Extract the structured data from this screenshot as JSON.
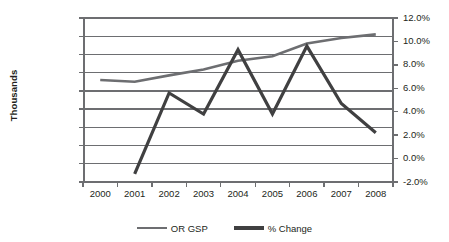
{
  "chart_data": {
    "type": "line",
    "title": "",
    "xlabel": "",
    "ylabel": "Thousands",
    "categories": [
      "2000",
      "2001",
      "2002",
      "2003",
      "2004",
      "2005",
      "2006",
      "2007",
      "2008"
    ],
    "grid": true,
    "legend_position": "bottom",
    "axes": {
      "left": {
        "label": "Thousands",
        "ylim": [
          0,
          180000
        ],
        "tick_step": 20000,
        "ticks": [
          "$0",
          "$20,000",
          "$40,000",
          "$60,000",
          "$80,000",
          "$100,000",
          "$120,000",
          "$140,000",
          "$160,000",
          "$180,000"
        ],
        "tick_values": [
          0,
          20000,
          40000,
          60000,
          80000,
          100000,
          120000,
          140000,
          160000,
          180000
        ]
      },
      "right": {
        "label": "",
        "ylim": [
          -2.0,
          12.0
        ],
        "tick_step": 2.0,
        "ticks": [
          "-2.0%",
          "0.0%",
          "2.0%",
          "4.0%",
          "6.0%",
          "8.0%",
          "10.0%",
          "12.0%"
        ],
        "tick_values": [
          -2.0,
          0.0,
          2.0,
          4.0,
          6.0,
          8.0,
          10.0,
          12.0
        ]
      }
    },
    "series": [
      {
        "name": "OR GSP",
        "axis": "left",
        "color": "#6d6e71",
        "width": 2.6,
        "x": [
          "2000",
          "2001",
          "2002",
          "2003",
          "2004",
          "2005",
          "2006",
          "2007",
          "2008"
        ],
        "values": [
          112000,
          110000,
          117000,
          123500,
          133000,
          138000,
          152000,
          158000,
          162000
        ]
      },
      {
        "name": "% Change",
        "axis": "right",
        "color": "#404041",
        "width": 3.2,
        "x": [
          "2001",
          "2002",
          "2003",
          "2004",
          "2005",
          "2006",
          "2007",
          "2008"
        ],
        "values": [
          -1.3,
          5.6,
          3.8,
          9.3,
          3.8,
          9.6,
          4.7,
          2.2
        ]
      }
    ]
  },
  "legend": {
    "items": [
      {
        "label": "OR GSP",
        "color": "#6d6e71",
        "thickness": "2.6px"
      },
      {
        "label": "% Change",
        "color": "#404041",
        "thickness": "3.6px"
      }
    ]
  },
  "colors": {
    "axis": "#6d6e71",
    "grid": "#6d6e71",
    "text": "#231f20",
    "background": "#ffffff"
  }
}
